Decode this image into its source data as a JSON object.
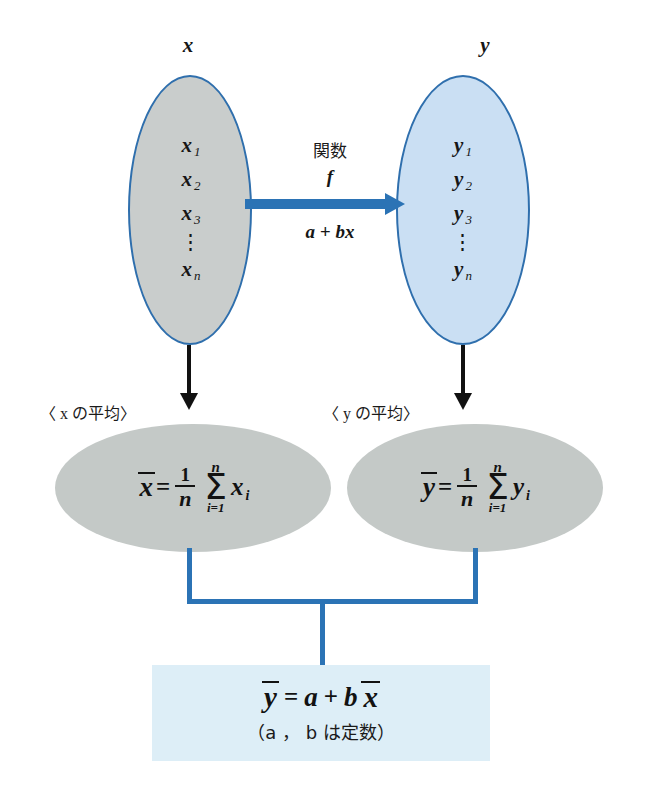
{
  "diagram": {
    "sets": {
      "x_set": {
        "title": "x",
        "members": [
          "x",
          "x",
          "x"
        ],
        "subscripts": [
          "1",
          "2",
          "3"
        ],
        "dots": "⋮",
        "last_member": "x",
        "last_subscript": "n"
      },
      "y_set": {
        "title": "y",
        "members": [
          "y",
          "y",
          "y"
        ],
        "subscripts": [
          "1",
          "2",
          "3"
        ],
        "dots": "⋮",
        "last_member": "y",
        "last_subscript": "n"
      }
    },
    "mapping": {
      "function_label": "関数",
      "function_name": "f",
      "expression": "a + bx"
    },
    "means": {
      "x_mean_label": "〈 x の平均〉",
      "y_mean_label": "〈 y の平均〉",
      "x_formula": {
        "lhs": "x",
        "equals": "=",
        "frac_num": "1",
        "frac_den": "n",
        "sigma_top": "n",
        "sigma_symbol": "Σ",
        "sigma_bottom": "i=1",
        "term": "x",
        "term_sub": "i"
      },
      "y_formula": {
        "lhs": "y",
        "equals": "=",
        "frac_num": "1",
        "frac_den": "n",
        "sigma_top": "n",
        "sigma_symbol": "Σ",
        "sigma_bottom": "i=1",
        "term": "y",
        "term_sub": "i"
      }
    },
    "result": {
      "lhs": "y",
      "equals": "=",
      "a": "a",
      "plus": "+",
      "b": "b",
      "x_bar": "x",
      "note": "（a ， b は定数）"
    },
    "colors": {
      "set_border": "#2f6fad",
      "gray_fill": "#c9cdcc",
      "blue_fill": "#cadff3",
      "mean_fill": "#c4c9c7",
      "result_fill": "#ddeef7",
      "connector_blue": "#2b73b5",
      "connector_black": "#111111"
    }
  }
}
